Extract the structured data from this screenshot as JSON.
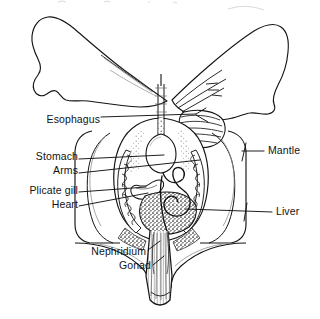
{
  "figure": {
    "style": "black-and-white line drawing with stippling and hatching",
    "background_color": "#ffffff",
    "line_color": "#121212",
    "label_text_color": "#121212",
    "faint_artifact_color": "#c8c8c8"
  },
  "labels": [
    {
      "id": "esophagus",
      "text": "Esophagus",
      "align": "right",
      "x": 36,
      "y": 114,
      "leader_to": "central esophageal tube near top of visceral mass"
    },
    {
      "id": "stomach",
      "text": "Stomach",
      "align": "right",
      "x": 27,
      "y": 156,
      "leader_to": "oval pale stomach in upper visceral mass"
    },
    {
      "id": "arms",
      "text": "Arms",
      "align": "right",
      "x": 45,
      "y": 170,
      "leader_to": "branching arms inside right mantle lobe"
    },
    {
      "id": "plicate_gill",
      "text": "Plicate gill",
      "align": "right",
      "x": 14,
      "y": 190,
      "leader_to": "folded plicate gill at left of visceral mass"
    },
    {
      "id": "heart",
      "text": "Heart",
      "align": "right",
      "x": 43,
      "y": 204,
      "leader_to": "heart region below stomach"
    },
    {
      "id": "mantle",
      "text": "Mantle",
      "align": "left",
      "x": 268,
      "y": 148,
      "leader_to": "outer mantle wall on right side"
    },
    {
      "id": "liver",
      "text": "Liver",
      "align": "left",
      "x": 276,
      "y": 209,
      "leader_to": "dark stippled digestive gland (liver) mass"
    },
    {
      "id": "nephridium",
      "text": "Nephridium",
      "align": "right",
      "x": 80,
      "y": 251,
      "leader_to": "nephridium near base of visceral mass"
    },
    {
      "id": "gonad",
      "text": "Gonad",
      "align": "right",
      "x": 118,
      "y": 265,
      "leader_to": "gonad tissue along the foot / tail axis"
    }
  ],
  "structures": [
    {
      "id": "left-mantle-lobe",
      "name": "Left mantle lobe (wing)",
      "description": "large wing-like lobe sweeping upper-left with a notched lower margin"
    },
    {
      "id": "right-mantle-lobe",
      "name": "Right mantle lobe (wing)",
      "description": "elongated wing-like lobe sweeping upper-right containing branching arm lines"
    },
    {
      "id": "striated-band",
      "name": "Striated muscle band",
      "description": "horizontally hatched band at the upper right of the visceral mass"
    },
    {
      "id": "visceral-mass",
      "name": "Visceral mass",
      "description": "central ovoid body containing stomach, heart, liver and gills"
    },
    {
      "id": "plicate-gill-left",
      "name": "Plicate gill (left)",
      "description": "corrugated comb-like folds on the left flank of the visceral mass"
    },
    {
      "id": "plicate-gill-right",
      "name": "Plicate gill (right)",
      "description": "corrugated comb-like folds on the right flank of the visceral mass"
    },
    {
      "id": "stomach-sac",
      "name": "Stomach",
      "description": "pale rounded sac in the upper visceral mass"
    },
    {
      "id": "liver-mass",
      "name": "Liver / digestive gland",
      "description": "dark densely stippled mass in the lower visceral mass"
    },
    {
      "id": "coiled-gut",
      "name": "Coiled intestine",
      "description": "looping tubular coil within the liver mass"
    },
    {
      "id": "esophagus-tube",
      "name": "Esophagus",
      "description": "narrow vertical tube running down the midline from the top"
    },
    {
      "id": "foot",
      "name": "Foot / tail",
      "description": "long tapering striated foot projecting downward, rounded at the tip"
    },
    {
      "id": "mantle-skirt",
      "name": "Mantle skirt",
      "description": "nested outer contour lines flaring out then down toward the foot"
    }
  ]
}
